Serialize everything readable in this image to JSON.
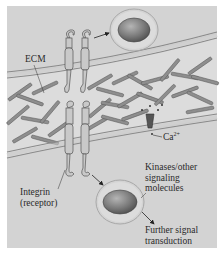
{
  "figure": {
    "background_color": "#d2d2d2",
    "membrane_color": "#9a9a9a",
    "fiber_color": "#8a8a8a",
    "vesicle_color": "#7c7c7c"
  },
  "labels": {
    "ecm": "ECM",
    "calcium": "Ca",
    "calcium_charge": "2+",
    "kinases_line1": "Kinases/other",
    "kinases_line2": "signaling",
    "kinases_line3": "molecules",
    "integrin_line1": "Integrin",
    "integrin_line2": "(receptor)",
    "further_line1": "Further signal",
    "further_line2": "transduction"
  }
}
